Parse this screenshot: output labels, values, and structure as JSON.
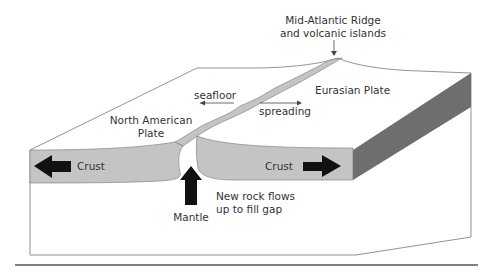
{
  "diagram": {
    "labels": {
      "ridge_line1": "Mid-Atlantic Ridge",
      "ridge_line2": "and volcanic islands",
      "seafloor": "seafloor",
      "spreading": "spreading",
      "eurasian": "Eurasian Plate",
      "north_american_line1": "North American",
      "north_american_line2": "Plate",
      "crust_left": "Crust",
      "crust_right": "Crust",
      "mantle": "Mantle",
      "new_rock_line1": "New rock flows",
      "new_rock_line2": "up to fill gap"
    },
    "colors": {
      "crust": "#c4c4c4",
      "side_band": "#6e6e6e",
      "arrow": "#111111",
      "outline": "#777777",
      "separator": "#555555"
    }
  }
}
